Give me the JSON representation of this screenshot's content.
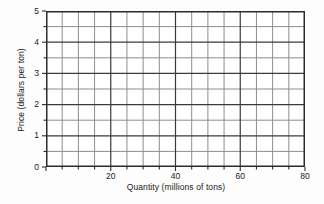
{
  "chart_data": {
    "type": "line",
    "title": "",
    "subtitle": "",
    "xlabel": "Quantity (millions of tons)",
    "ylabel": "Price (dollars per ton)",
    "xlim": [
      0,
      80
    ],
    "ylim": [
      0,
      5
    ],
    "x_major_ticks": [
      0,
      20,
      40,
      60,
      80
    ],
    "x_tick_labels": [
      "",
      "20",
      "40",
      "60",
      "80"
    ],
    "x_minor_step": 5,
    "x_all_ticks": [
      0,
      5,
      10,
      15,
      20,
      25,
      30,
      35,
      40,
      45,
      50,
      55,
      60,
      65,
      70,
      75,
      80
    ],
    "y_major_ticks": [
      0,
      1,
      2,
      3,
      4,
      5
    ],
    "y_tick_labels": [
      "0",
      "1",
      "2",
      "3",
      "4",
      "5"
    ],
    "y_minor_step": 0.5,
    "y_all_ticks": [
      0,
      0.5,
      1,
      1.5,
      2,
      2.5,
      3,
      3.5,
      4,
      4.5,
      5
    ],
    "grid": true,
    "grid_major_color": "#3a3a3a",
    "grid_minor_color": "#8d8d8d",
    "legend": null,
    "legend_position": "none",
    "series": [],
    "annotations": [],
    "note": "Empty graph grid with no plotted data series"
  },
  "figure": {
    "background_color": "#fdfdfd",
    "plot_background_color": "#ffffff",
    "frame_color": "#2b2b2b",
    "text_color": "#1a1a1a"
  }
}
